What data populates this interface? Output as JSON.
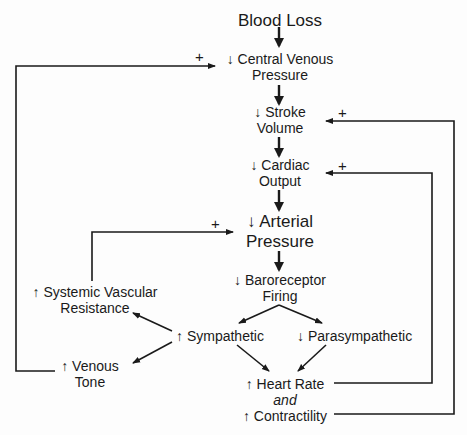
{
  "diagram": {
    "title": "Blood Loss",
    "nodes": {
      "blood_loss": {
        "line1": "Blood Loss"
      },
      "cvp": {
        "line1": "↓ Central Venous",
        "line2": "Pressure"
      },
      "stroke_volume": {
        "line1": "↓ Stroke",
        "line2": "Volume"
      },
      "cardiac_output": {
        "line1": "↓ Cardiac",
        "line2": "Output"
      },
      "arterial_pressure": {
        "line1": "↓ Arterial",
        "line2": "Pressure"
      },
      "baroreceptor": {
        "line1": "↓ Baroreceptor",
        "line2": "Firing"
      },
      "sympathetic": {
        "line1": "↑ Sympathetic"
      },
      "parasympathetic": {
        "line1": "↓ Parasympathetic"
      },
      "svr": {
        "line1": "↑ Systemic Vascular",
        "line2": "Resistance"
      },
      "venous_tone": {
        "line1": "↑ Venous",
        "line2": "Tone"
      },
      "hr_contractility": {
        "line1": "↑ Heart Rate",
        "line2": "and",
        "line3": "↑ Contractility"
      }
    },
    "feedback_labels": {
      "venous_tone_to_cvp": "+",
      "contractility_to_stroke_volume": "+",
      "heart_rate_to_cardiac_output": "+",
      "svr_to_arterial_pressure": "+"
    },
    "colors": {
      "line": "#1a1a1a",
      "background": "#fdfdfd",
      "text": "#1a1a1a"
    }
  }
}
